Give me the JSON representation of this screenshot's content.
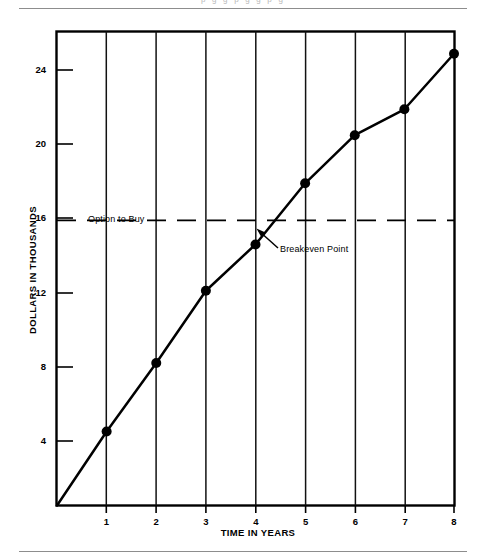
{
  "page": {
    "clipped_header_fragment": "p      g              g          p        g            g            p         g"
  },
  "figure": {
    "y_axis_title": "DOLLARS IN THOUSANDS",
    "x_axis_title": "TIME IN YEARS",
    "annotations": {
      "option_to_buy": "Option to Buy",
      "breakeven_point": "Breakeven Point"
    }
  },
  "chart_data": {
    "type": "line",
    "title": "",
    "subtitle": "",
    "xlabel": "TIME IN YEARS",
    "ylabel": "DOLLARS IN THOUSANDS",
    "x": [
      0,
      1,
      2,
      3,
      4,
      5,
      6,
      7,
      8
    ],
    "xlim": [
      0,
      8
    ],
    "ylim": [
      0,
      25.6
    ],
    "xticks": [
      1,
      2,
      3,
      4,
      5,
      6,
      7,
      8
    ],
    "xtick_labels": [
      "1",
      "2",
      "3",
      "4",
      "5",
      "6",
      "7",
      "8"
    ],
    "yticks": [
      4,
      8,
      12,
      16,
      20,
      24
    ],
    "ytick_labels": [
      "4",
      "8",
      "12",
      "16",
      "20",
      "24"
    ],
    "grid": "vertical-only",
    "legend": "none",
    "series": [
      {
        "name": "Cumulative lease cost",
        "style": "solid-with-markers",
        "marker": "filled-circle",
        "color": "#000000",
        "values": [
          0,
          4.0,
          7.7,
          11.6,
          14.1,
          17.4,
          20.0,
          21.4,
          24.4
        ]
      },
      {
        "name": "Option to Buy",
        "style": "dashed-horizontal-reference",
        "color": "#000000",
        "y_value": 15.4
      }
    ],
    "annotations": [
      {
        "text": "Option to Buy",
        "x": 0.38,
        "y": 16.3,
        "points_to": "dashed reference line"
      },
      {
        "text": "Breakeven Point",
        "x": 5.1,
        "y": 14.5,
        "arrow": true,
        "points_to": "intersection of cost line and Option to Buy line, approx x=4.45, y=15.4"
      }
    ]
  }
}
